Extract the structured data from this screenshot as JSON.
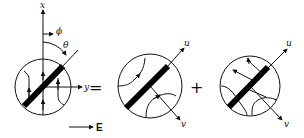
{
  "figure": {
    "panel_left": {
      "axis_x_label": "x",
      "axis_y_label": "y",
      "phi_label": "ϕ",
      "theta_label": "θ"
    },
    "equals_sign": "=",
    "panel_middle": {
      "axis_u_label": "u",
      "axis_v_label": "v"
    },
    "plus_sign": "+",
    "panel_right": {
      "axis_u_label": "u",
      "axis_v_label": "v"
    },
    "field_label": "E",
    "colors": {
      "ink": "#111111",
      "background": "#ffffff"
    }
  }
}
